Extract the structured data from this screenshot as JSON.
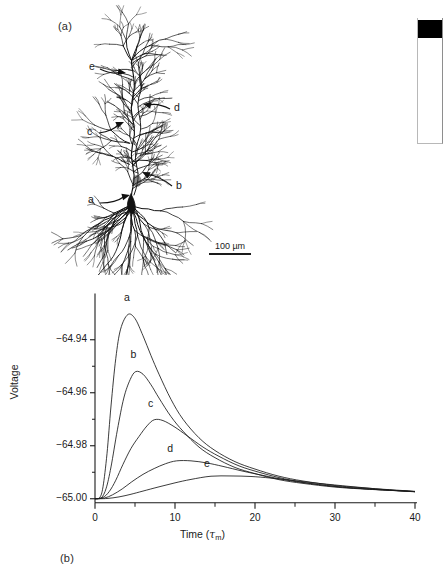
{
  "figure": {
    "panel_a_label": "(a)",
    "panel_b_label": "(b)"
  },
  "panel_a": {
    "name": "neuron-morphology",
    "scale_bar": {
      "text": "100 µm",
      "length_px": 42
    },
    "markers": [
      {
        "id": "a",
        "label": "a",
        "label_x": 88,
        "label_y": 200,
        "tip_x": 130,
        "tip_y": 195,
        "tail_x": 100,
        "tail_y": 203
      },
      {
        "id": "b",
        "label": "b",
        "label_x": 176,
        "label_y": 186,
        "tip_x": 142,
        "tip_y": 172,
        "tail_x": 172,
        "tail_y": 186
      },
      {
        "id": "c",
        "label": "c",
        "label_x": 87,
        "label_y": 132,
        "tip_x": 124,
        "tip_y": 122,
        "tail_x": 99,
        "tail_y": 133
      },
      {
        "id": "d",
        "label": "d",
        "label_x": 174,
        "label_y": 108,
        "tip_x": 143,
        "tip_y": 104,
        "tail_x": 170,
        "tail_y": 109
      },
      {
        "id": "e",
        "label": "e",
        "label_x": 89,
        "label_y": 67,
        "tip_x": 126,
        "tip_y": 73,
        "tail_x": 100,
        "tail_y": 69
      }
    ]
  },
  "chart_data": {
    "type": "line",
    "title": "",
    "xlabel": "Time (τm)",
    "ylabel": "Voltage",
    "xlim": [
      0,
      40
    ],
    "ylim": [
      -65.005,
      -64.925
    ],
    "grid": false,
    "legend": "inline curve labels a–e",
    "xticks": [
      0,
      10,
      20,
      30,
      40
    ],
    "xtick_labels": [
      "0",
      "10",
      "20",
      "30",
      "40"
    ],
    "xminor_ticks": [
      5,
      15,
      25,
      35
    ],
    "yticks": [
      -64.94,
      -64.96,
      -64.98,
      -65.0
    ],
    "ytick_labels": [
      "−64.94",
      "−64.96",
      "−64.98",
      "−65.00"
    ],
    "yminor_ticks": [
      -64.95,
      -64.97,
      -64.99
    ],
    "series": [
      {
        "name": "a",
        "label": "a",
        "label_t": 4.0,
        "label_v": -64.9265,
        "peak_t": 4.1,
        "peak_v": -64.9305,
        "x": [
          0,
          0.6,
          1.0,
          1.5,
          2.0,
          2.6,
          3.2,
          4.1,
          5.0,
          6.0,
          7.0,
          8.0,
          9.5,
          11.0,
          13.0,
          15.0,
          17.5,
          20.0,
          23.0,
          26.0,
          30.0,
          34.0,
          40.0
        ],
        "y": [
          -65.0,
          -64.9995,
          -64.9955,
          -64.983,
          -64.965,
          -64.947,
          -64.936,
          -64.9305,
          -64.932,
          -64.9385,
          -64.946,
          -64.953,
          -64.9625,
          -64.97,
          -64.977,
          -64.9818,
          -64.986,
          -64.9888,
          -64.9915,
          -64.9933,
          -64.995,
          -64.996,
          -64.9972
        ]
      },
      {
        "name": "b",
        "label": "b",
        "label_t": 4.8,
        "label_v": -64.948,
        "peak_t": 5.1,
        "peak_v": -64.952,
        "x": [
          0,
          0.8,
          1.4,
          2.0,
          2.8,
          3.6,
          4.4,
          5.1,
          6.0,
          7.0,
          8.0,
          9.5,
          11.0,
          13.0,
          15.0,
          17.5,
          20.0,
          23.0,
          26.0,
          30.0,
          34.0,
          40.0
        ],
        "y": [
          -65.0,
          -64.9996,
          -64.996,
          -64.988,
          -64.974,
          -64.962,
          -64.955,
          -64.952,
          -64.953,
          -64.957,
          -64.962,
          -64.969,
          -64.9745,
          -64.9805,
          -64.9845,
          -64.9882,
          -64.9905,
          -64.9928,
          -64.9942,
          -64.9956,
          -64.9964,
          -64.9973
        ]
      },
      {
        "name": "c",
        "label": "c",
        "label_t": 7.0,
        "label_v": -64.9665,
        "peak_t": 7.4,
        "peak_v": -64.9702,
        "x": [
          0,
          1.0,
          1.8,
          2.6,
          3.5,
          4.5,
          5.5,
          6.5,
          7.4,
          8.5,
          10.0,
          11.5,
          13.5,
          15.5,
          18.0,
          20.5,
          23.0,
          26.0,
          30.0,
          34.0,
          40.0
        ],
        "y": [
          -65.0,
          -64.9995,
          -64.9972,
          -64.993,
          -64.987,
          -64.981,
          -64.9765,
          -64.9725,
          -64.9702,
          -64.9705,
          -64.973,
          -64.9762,
          -64.9805,
          -64.984,
          -64.9876,
          -64.99,
          -64.992,
          -64.9938,
          -64.9954,
          -64.9963,
          -64.9973
        ]
      },
      {
        "name": "d",
        "label": "d",
        "label_t": 9.4,
        "label_v": -64.9835,
        "peak_t": 10.2,
        "peak_v": -64.9857,
        "x": [
          0,
          1.2,
          2.2,
          3.4,
          4.6,
          6.0,
          7.4,
          8.8,
          10.2,
          12.0,
          14.0,
          16.0,
          18.5,
          21.0,
          24.0,
          27.0,
          31.0,
          35.0,
          40.0
        ],
        "y": [
          -65.0,
          -64.9997,
          -64.9985,
          -64.9963,
          -64.9936,
          -64.9908,
          -64.9886,
          -64.9868,
          -64.9857,
          -64.9857,
          -64.9865,
          -64.9878,
          -64.9896,
          -64.9912,
          -64.993,
          -64.9943,
          -64.9956,
          -64.9965,
          -64.9973
        ]
      },
      {
        "name": "e",
        "label": "e",
        "label_t": 14.0,
        "label_v": -64.9893,
        "peak_t": 14.5,
        "peak_v": -64.9915,
        "x": [
          0,
          1.5,
          3.0,
          4.5,
          6.0,
          8.0,
          10.0,
          12.0,
          14.5,
          17.0,
          19.5,
          22.0,
          25.0,
          28.0,
          32.0,
          36.0,
          40.0
        ],
        "y": [
          -65.0,
          -64.9999,
          -64.9993,
          -64.9983,
          -64.9971,
          -64.9955,
          -64.994,
          -64.9927,
          -64.9915,
          -64.9914,
          -64.9916,
          -64.9922,
          -64.9932,
          -64.9942,
          -64.9954,
          -64.9965,
          -64.9974
        ]
      }
    ]
  },
  "scrollbar": {
    "name": "vertical-scrollbar",
    "thumb_position": "top"
  }
}
